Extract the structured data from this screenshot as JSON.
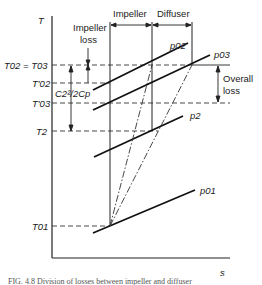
{
  "diagram": {
    "type": "T-s diagram",
    "axes": {
      "y_label": "T",
      "x_label": "s"
    },
    "temperature_labels": {
      "t02_eq_t03": "T02 = T03",
      "t02_prime": "T'02",
      "t03_prime": "T'03",
      "t2": "T2",
      "t01": "T01"
    },
    "pressure_labels": {
      "p02": "p02",
      "p03": "p03",
      "p2": "p2",
      "p01": "p01"
    },
    "region_labels": {
      "impeller": "Impeller",
      "diffuser": "Diffuser"
    },
    "annotations": {
      "impeller_loss_line1": "Impeller",
      "impeller_loss_line2": "loss",
      "kinetic_term": "C2²/2Cp",
      "overall_loss_line1": "Overall",
      "overall_loss_line2": "loss"
    },
    "caption": "FIG. 4.8 Division of losses between impeller and diffuser"
  }
}
